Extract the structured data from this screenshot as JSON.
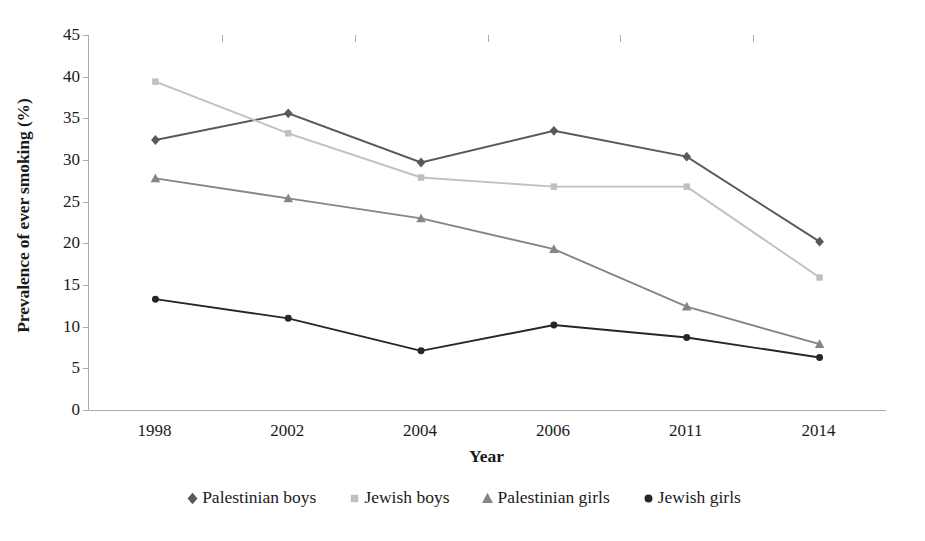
{
  "chart_data": {
    "type": "line",
    "title": "",
    "xlabel": "Year",
    "ylabel": "Prevalence of ever smoking (%)",
    "categories": [
      "1998",
      "2002",
      "2004",
      "2006",
      "2011",
      "2014"
    ],
    "ylim": [
      0,
      45
    ],
    "yticks": [
      0,
      5,
      10,
      15,
      20,
      25,
      30,
      35,
      40,
      45
    ],
    "ytick_labels": [
      "0",
      "5",
      "10",
      "15",
      "20",
      "25",
      "30",
      "35",
      "40",
      "45"
    ],
    "grid": false,
    "legend_position": "bottom",
    "series": [
      {
        "name": "Palestinian boys",
        "marker": "diamond",
        "color": "#595959",
        "values": [
          32.4,
          35.6,
          29.7,
          33.5,
          30.4,
          20.2
        ]
      },
      {
        "name": "Jewish boys",
        "marker": "square",
        "color": "#c0c0c0",
        "values": [
          39.4,
          33.2,
          27.9,
          26.8,
          26.8,
          15.9
        ]
      },
      {
        "name": "Palestinian girls",
        "marker": "triangle",
        "color": "#858585",
        "values": [
          27.8,
          25.4,
          23.0,
          19.3,
          12.4,
          7.9
        ]
      },
      {
        "name": "Jewish girls",
        "marker": "circle",
        "color": "#262626",
        "values": [
          13.3,
          11.0,
          7.1,
          10.2,
          8.7,
          6.3
        ]
      }
    ]
  },
  "axes": {
    "frame_color": "#aaaaaa"
  }
}
